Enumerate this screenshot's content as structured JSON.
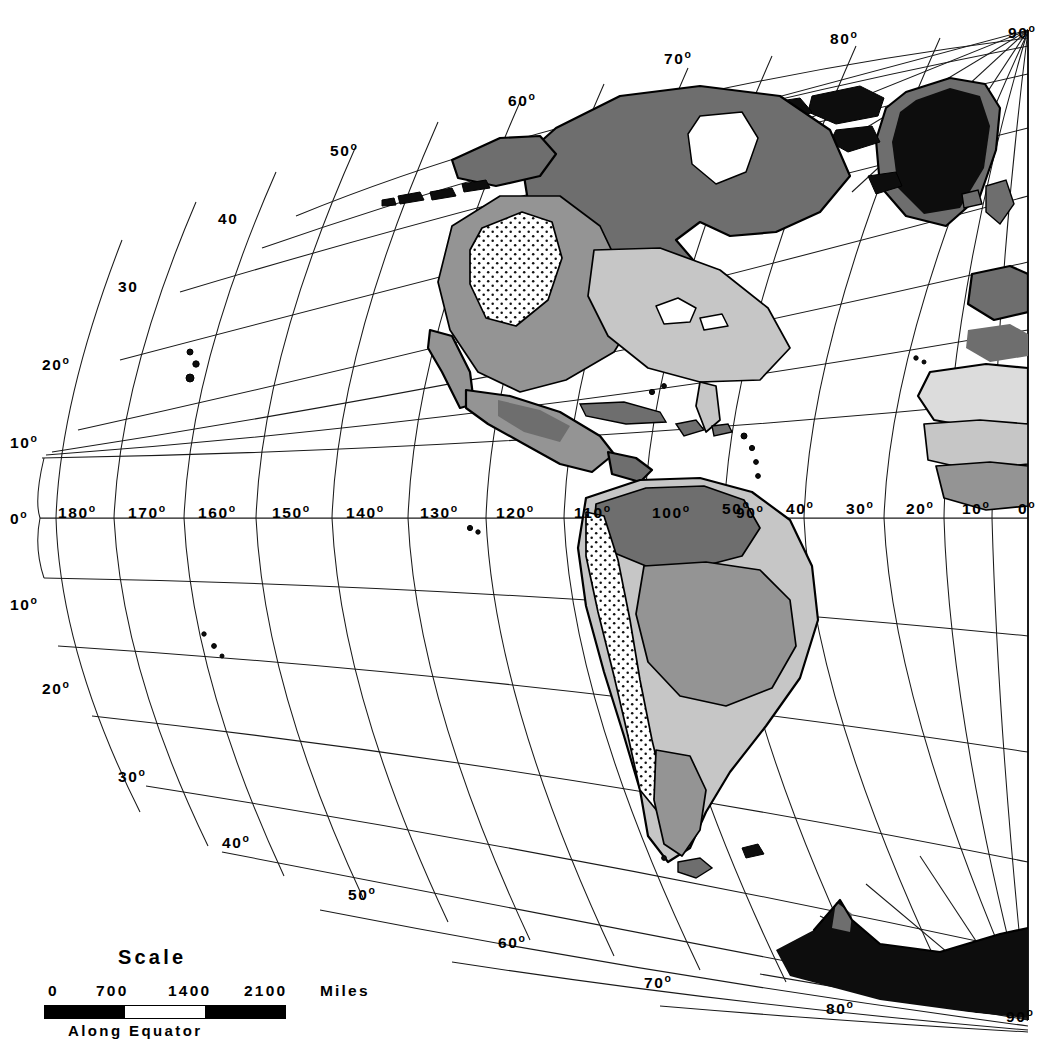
{
  "map": {
    "title": "Western Hemisphere Thematic Map",
    "projection_note": "curved graticule converging at pole",
    "grid_interval_degrees": 10,
    "colors": {
      "icecap": "#0d0d0d",
      "dark_zone": "#6e6e6e",
      "mid_zone": "#949494",
      "light_zone": "#c6c6c6",
      "pale_zone": "#dcdcdc",
      "unshaded": "#ffffff",
      "line": "#000000"
    }
  },
  "scale": {
    "title": "Scale",
    "ticks": [
      "0",
      "700",
      "1400",
      "2100"
    ],
    "units": "Miles",
    "footer": "Along  Equator"
  },
  "equator_labels_west": [
    "0",
    "180",
    "170",
    "160",
    "150",
    "140",
    "130",
    "120",
    "110",
    "100",
    "90"
  ],
  "equator_labels_east": [
    "50",
    "40",
    "30",
    "20",
    "10",
    "0"
  ],
  "latitude_labels_left_north": [
    "10",
    "20",
    "30",
    "40",
    "50"
  ],
  "latitude_labels_left_south": [
    "10",
    "20",
    "30",
    "40",
    "50",
    "60"
  ],
  "top_edge_labels": [
    "50",
    "60",
    "70",
    "80",
    "90"
  ],
  "bottom_edge_labels": [
    "70",
    "80",
    "90"
  ],
  "labels": {
    "lat_10n": "10",
    "lat_20n": "20",
    "lat_30n": "30",
    "lat_40n": "40",
    "lat_50n": "50",
    "lat_10s": "10",
    "lat_20s": "20",
    "lat_30s": "30",
    "lat_40s": "40",
    "lat_50s": "50",
    "lat_60s": "60",
    "top_50": "50",
    "top_60": "60",
    "top_70": "70",
    "top_80": "80",
    "top_90": "90",
    "bot_70": "70",
    "bot_80": "80",
    "bot_90": "90",
    "eq_0_left": "0",
    "eq_180": "180",
    "eq_170": "170",
    "eq_160": "160",
    "eq_150": "150",
    "eq_140": "140",
    "eq_130": "130",
    "eq_120": "120",
    "eq_110": "110",
    "eq_100": "100",
    "eq_90": "90",
    "eq_50": "50",
    "eq_40": "40",
    "eq_30": "30",
    "eq_20": "20",
    "eq_10": "10",
    "eq_0_right": "0",
    "degree_symbol": "o"
  }
}
